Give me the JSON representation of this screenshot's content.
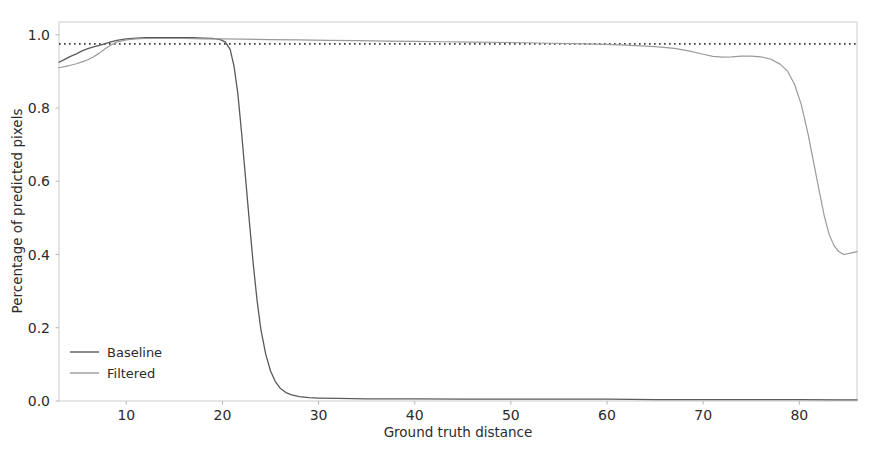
{
  "chart_data": {
    "type": "line",
    "title": "",
    "xlabel": "Ground truth distance",
    "ylabel": "Percentage of predicted pixels",
    "xlim": [
      3.0,
      86.0
    ],
    "ylim": [
      0.0,
      1.035
    ],
    "grid": false,
    "legend_position": "lower-left",
    "xticks": [
      10,
      20,
      30,
      40,
      50,
      60,
      70,
      80
    ],
    "xtick_labels": [
      "10",
      "20",
      "30",
      "40",
      "50",
      "60",
      "70",
      "80"
    ],
    "yticks": [
      0.0,
      0.2,
      0.4,
      0.6,
      0.8,
      1.0
    ],
    "ytick_labels": [
      "0.0",
      "0.2",
      "0.4",
      "0.6",
      "0.8",
      "1.0"
    ],
    "annotations": [
      {
        "name": "reference-dotted-line",
        "style": "dotted",
        "color": "#3a3a3a",
        "y": 0.975,
        "x_from": 3.0,
        "x_to": 86.0
      }
    ],
    "series": [
      {
        "name": "Baseline",
        "color": "#5a5a5a",
        "linewidth": 1.3,
        "x": [
          3.0,
          3.6,
          4.2,
          4.8,
          5.4,
          6.0,
          6.6,
          7.2,
          7.8,
          8.4,
          9.0,
          10.0,
          11.0,
          12.0,
          13.0,
          14.0,
          15.0,
          16.0,
          17.0,
          18.0,
          19.0,
          19.8,
          20.3,
          20.8,
          21.2,
          21.6,
          22.0,
          22.4,
          22.8,
          23.2,
          23.6,
          24.0,
          24.5,
          25.0,
          25.5,
          26.0,
          26.6,
          27.2,
          28.0,
          29.0,
          30.0,
          32.0,
          35.0,
          40.0,
          45.0,
          50.0,
          55.0,
          60.0,
          65.0,
          70.0,
          75.0,
          80.0,
          84.0,
          86.0
        ],
        "y": [
          0.925,
          0.933,
          0.941,
          0.948,
          0.956,
          0.962,
          0.967,
          0.971,
          0.976,
          0.981,
          0.985,
          0.989,
          0.991,
          0.992,
          0.992,
          0.992,
          0.992,
          0.992,
          0.992,
          0.991,
          0.99,
          0.987,
          0.98,
          0.96,
          0.915,
          0.84,
          0.73,
          0.61,
          0.49,
          0.375,
          0.275,
          0.195,
          0.128,
          0.082,
          0.053,
          0.035,
          0.023,
          0.017,
          0.012,
          0.009,
          0.008,
          0.007,
          0.006,
          0.006,
          0.005,
          0.005,
          0.005,
          0.005,
          0.004,
          0.004,
          0.004,
          0.004,
          0.003,
          0.003
        ]
      },
      {
        "name": "Filtered",
        "color": "#9a9a9a",
        "linewidth": 1.2,
        "x": [
          3.0,
          3.6,
          4.2,
          4.8,
          5.4,
          6.0,
          6.6,
          7.2,
          7.8,
          8.4,
          9.0,
          10.0,
          11.0,
          12.0,
          14.0,
          16.0,
          18.0,
          20.0,
          22.0,
          25.0,
          28.0,
          31.0,
          34.0,
          37.0,
          40.0,
          43.0,
          46.0,
          50.0,
          54.0,
          58.0,
          62.0,
          65.0,
          67.0,
          68.5,
          70.0,
          71.0,
          72.0,
          73.0,
          74.0,
          75.0,
          76.0,
          77.0,
          78.0,
          78.8,
          79.5,
          80.2,
          80.9,
          81.5,
          82.1,
          82.6,
          83.1,
          83.6,
          84.1,
          84.6,
          85.2,
          86.0
        ],
        "y": [
          0.91,
          0.913,
          0.917,
          0.921,
          0.926,
          0.932,
          0.94,
          0.95,
          0.962,
          0.972,
          0.98,
          0.986,
          0.989,
          0.99,
          0.99,
          0.99,
          0.989,
          0.989,
          0.988,
          0.987,
          0.986,
          0.985,
          0.984,
          0.983,
          0.982,
          0.981,
          0.98,
          0.979,
          0.977,
          0.975,
          0.972,
          0.968,
          0.963,
          0.956,
          0.947,
          0.941,
          0.939,
          0.94,
          0.942,
          0.942,
          0.94,
          0.934,
          0.92,
          0.9,
          0.865,
          0.81,
          0.73,
          0.65,
          0.57,
          0.505,
          0.455,
          0.425,
          0.408,
          0.4,
          0.403,
          0.408
        ]
      }
    ]
  },
  "legend": {
    "entries": [
      {
        "label": "Baseline",
        "color": "#5a5a5a"
      },
      {
        "label": "Filtered",
        "color": "#9a9a9a"
      }
    ]
  },
  "axes": {
    "xlabel": "Ground truth distance",
    "ylabel": "Percentage of predicted pixels"
  }
}
